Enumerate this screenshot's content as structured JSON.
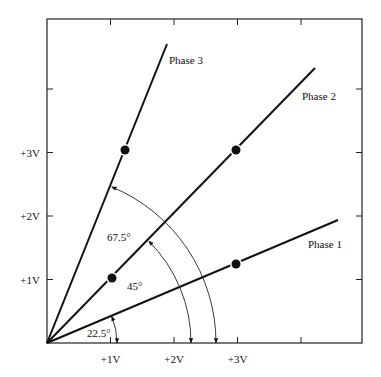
{
  "diagram": {
    "frame": {
      "left": 47,
      "top": 19,
      "right": 362,
      "bottom": 343
    },
    "origin": {
      "x": 47,
      "y": 343
    },
    "unit_px": 63.5,
    "x_ticks": [
      {
        "value": 1,
        "label": "+1V"
      },
      {
        "value": 2,
        "label": "+2V"
      },
      {
        "value": 3,
        "label": "+3V"
      },
      {
        "value": 4,
        "label": ""
      }
    ],
    "y_ticks": [
      {
        "value": 1,
        "label": "+1V"
      },
      {
        "value": 2,
        "label": "+2V"
      },
      {
        "value": 3,
        "label": "+3V"
      },
      {
        "value": 4,
        "label": ""
      }
    ],
    "phases": [
      {
        "name": "Phase 1",
        "end": {
          "x": 338,
          "y": 220
        },
        "dot": {
          "x": 236,
          "y": 264
        },
        "label_pos": {
          "x": 308,
          "y": 248
        }
      },
      {
        "name": "Phase 2",
        "end": {
          "x": 315,
          "y": 68
        },
        "dot": {
          "x": 236,
          "y": 150
        },
        "label_pos": {
          "x": 302,
          "y": 100
        }
      },
      {
        "name": "Phase 3",
        "end": {
          "x": 167,
          "y": 44
        },
        "dot": {
          "x": 125,
          "y": 150
        },
        "label_pos": {
          "x": 169,
          "y": 64
        }
      }
    ],
    "extra_dots": [
      {
        "x": 112,
        "y": 278
      }
    ],
    "angles": [
      {
        "label": "22.5°",
        "radius": 70,
        "deg": 22.5,
        "label_pos": {
          "x": 87,
          "y": 337
        }
      },
      {
        "label": "45°",
        "radius": 144,
        "deg": 45,
        "label_pos": {
          "x": 127,
          "y": 290
        }
      },
      {
        "label": "67.5°",
        "radius": 169,
        "deg": 67.5,
        "label_pos": {
          "x": 107,
          "y": 241
        }
      }
    ]
  }
}
